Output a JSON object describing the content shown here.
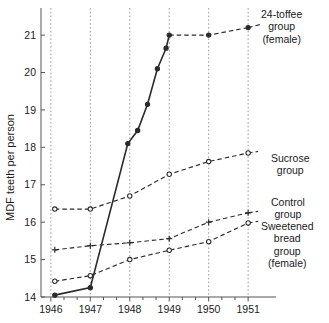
{
  "chart_data": {
    "type": "line",
    "title": "",
    "xlabel": "",
    "ylabel": "MDF teeth per person",
    "xlim": [
      1945.75,
      1951.25
    ],
    "ylim": [
      14,
      21.35
    ],
    "yticks": [
      14,
      15,
      16,
      17,
      18,
      19,
      20,
      21
    ],
    "ytick_labels": [
      "14",
      "15",
      "16",
      "17",
      "18",
      "19",
      "20",
      "21"
    ],
    "xticks": [
      1946,
      1947,
      1948,
      1949,
      1950,
      1951
    ],
    "xtick_labels": [
      "1946",
      "1947",
      "1948",
      "1949",
      "1950",
      "1951"
    ],
    "grid": "vertical dotted gridlines at each year",
    "legend_position": "right of plot, inline labels at series ends",
    "series": [
      {
        "name": "24-toffee group (female)",
        "label_lines": [
          "24-toffee",
          "group",
          "(female)"
        ],
        "style": "solid then dashed",
        "marker": "filled-circle",
        "x": [
          1946.1,
          1947.0,
          1947.95,
          1948.2,
          1948.45,
          1948.7,
          1948.92,
          1949.0,
          1950.0,
          1951.0
        ],
        "y": [
          14.05,
          14.25,
          18.1,
          18.45,
          19.15,
          20.1,
          20.65,
          21.0,
          21.0,
          21.2
        ]
      },
      {
        "name": "Sucrose group",
        "label_lines": [
          "Sucrose",
          "group"
        ],
        "style": "dashed",
        "marker": "open-circle",
        "x": [
          1946.1,
          1947.0,
          1948.0,
          1949.0,
          1950.0,
          1951.0
        ],
        "y": [
          16.35,
          16.35,
          16.7,
          17.28,
          17.62,
          17.85
        ]
      },
      {
        "name": "Control group",
        "label_lines": [
          "Control",
          "group"
        ],
        "style": "dashed",
        "marker": "plus",
        "x": [
          1946.1,
          1947.0,
          1948.0,
          1949.0,
          1950.0,
          1951.0
        ],
        "y": [
          15.26,
          15.37,
          15.45,
          15.56,
          16.0,
          16.25
        ]
      },
      {
        "name": "Sweetened bread group (female)",
        "label_lines": [
          "Sweetened",
          "bread",
          "group",
          "(female)"
        ],
        "style": "dashed",
        "marker": "open-circle",
        "x": [
          1946.1,
          1947.0,
          1948.0,
          1949.0,
          1950.0,
          1951.0
        ],
        "y": [
          14.42,
          14.57,
          15.0,
          15.25,
          15.48,
          15.98
        ]
      }
    ]
  },
  "legend": {
    "toffee": "24-toffee\ngroup\n(female)",
    "sucrose": "Sucrose\ngroup",
    "control": "Control\ngroup",
    "bread": "Sweetened\nbread\ngroup\n(female)"
  },
  "axes": {
    "y_title": "MDF teeth per person"
  }
}
